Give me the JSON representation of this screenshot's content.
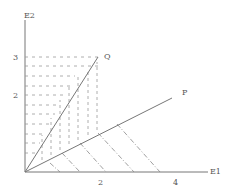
{
  "axes": {
    "x_label": "E1",
    "y_label": "E2",
    "x_ticks": [
      {
        "value": "2",
        "x": 100
      },
      {
        "value": "4",
        "x": 175
      }
    ],
    "y_ticks": [
      {
        "value": "3",
        "y": 57
      },
      {
        "value": "2",
        "y": 95
      }
    ]
  },
  "rays": {
    "Q": {
      "label": "Q"
    },
    "P": {
      "label": "P"
    }
  },
  "colors": {
    "line": "#777777",
    "dash": "#888888",
    "text": "#555555"
  }
}
